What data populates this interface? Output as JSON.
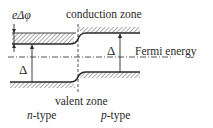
{
  "diagram": {
    "labels": {
      "e_delta_phi": "eΔφ",
      "conduction_zone": "conduction zone",
      "fermi_energy": "Fermi energy",
      "valent_zone": "valent zone",
      "n_type_prefix": "n",
      "n_type_suffix": "-type",
      "p_type_prefix": "p",
      "p_type_suffix": "-type",
      "delta_left": "Δ",
      "delta_right": "Δ"
    },
    "colors": {
      "line": "#2a2a2a",
      "hatch": "#555555",
      "background": "#ffffff"
    }
  }
}
